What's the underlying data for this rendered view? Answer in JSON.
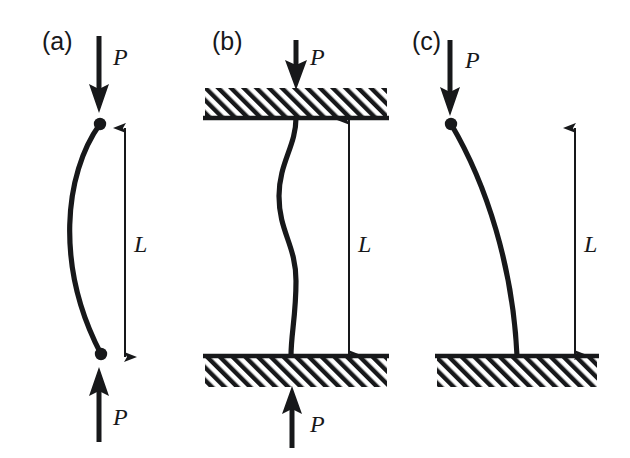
{
  "figure": {
    "background_color": "#ffffff",
    "ink_color": "#17181a",
    "width": 630,
    "height": 458
  },
  "panels": [
    {
      "id": "a",
      "label": "(a)",
      "label_x": 42,
      "label_y": 50,
      "support_condition": "pinned-pinned",
      "buckled_shape": "half-sine bow to the left",
      "loads": [
        {
          "name": "top-load",
          "label": "P",
          "direction": "down",
          "label_x": 113,
          "label_y": 65
        },
        {
          "name": "bottom-load",
          "label": "P",
          "direction": "up",
          "label_x": 113,
          "label_y": 425
        }
      ],
      "dimension": {
        "name": "length-dimension",
        "label": "L",
        "label_x": 134,
        "label_y": 252,
        "arrow_style": "double-headed",
        "top_y": 128,
        "bottom_y": 357
      }
    },
    {
      "id": "b",
      "label": "(b)",
      "label_x": 212,
      "label_y": 50,
      "support_condition": "fixed-fixed",
      "buckled_shape": "full-sine S curve",
      "loads": [
        {
          "name": "top-load",
          "label": "P",
          "direction": "down",
          "label_x": 310,
          "label_y": 65
        },
        {
          "name": "bottom-load",
          "label": "P",
          "direction": "up",
          "label_x": 310,
          "label_y": 432
        }
      ],
      "dimension": {
        "name": "length-dimension",
        "label": "L",
        "label_x": 358,
        "label_y": 252,
        "arrow_style": "double-headed",
        "top_y": 120,
        "bottom_y": 355
      }
    },
    {
      "id": "c",
      "label": "(c)",
      "label_x": 412,
      "label_y": 50,
      "support_condition": "fixed-free cantilever",
      "buckled_shape": "quarter-sine bow to the right",
      "loads": [
        {
          "name": "top-load",
          "label": "P",
          "direction": "down",
          "label_x": 465,
          "label_y": 68
        }
      ],
      "dimension": {
        "name": "length-dimension",
        "label": "L",
        "label_x": 584,
        "label_y": 252,
        "arrow_style": "double-headed",
        "top_y": 128,
        "bottom_y": 355
      }
    }
  ],
  "supports": [
    {
      "name": "support-block-b-top",
      "panel": "b",
      "x": 205,
      "y": 88,
      "width": 182,
      "height": 30,
      "face": "bottom"
    },
    {
      "name": "support-block-b-bottom",
      "panel": "b",
      "x": 205,
      "y": 355,
      "width": 182,
      "height": 30,
      "face": "top"
    },
    {
      "name": "support-block-c-base",
      "panel": "c",
      "x": 437,
      "y": 355,
      "width": 160,
      "height": 30,
      "face": "top"
    }
  ]
}
